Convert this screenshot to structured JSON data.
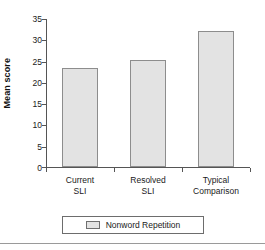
{
  "chart_data": {
    "type": "bar",
    "title": "",
    "xlabel": "",
    "ylabel": "Mean score",
    "ylim": [
      0,
      35
    ],
    "yticks": [
      0,
      5,
      10,
      15,
      20,
      25,
      30,
      35
    ],
    "ytick_labels": [
      "0",
      "5",
      "10",
      "15",
      "20",
      "25",
      "30",
      "35"
    ],
    "grid": false,
    "legend_position": "bottom",
    "categories": [
      "Current SLI",
      "Resolved SLI",
      "Typical Comparison"
    ],
    "category_lines": [
      [
        "Current",
        "SLI"
      ],
      [
        "Resolved",
        "SLI"
      ],
      [
        "Typical",
        "Comparison"
      ]
    ],
    "series": [
      {
        "name": "Nonword Repetition",
        "values": [
          23.5,
          25.3,
          32.2
        ],
        "fill_color": "#e3e3e3",
        "edge_color": "#8d8d8d"
      }
    ]
  },
  "legend": {
    "entries": [
      {
        "label": "Nonword Repetition",
        "swatch_name": "nonword-repetition-swatch"
      }
    ]
  },
  "colors": {
    "bar_fill": "#e3e3e3",
    "bar_edge": "#8d8d8d",
    "axis": "#555555",
    "text": "#1a1a1a",
    "rule": "#9a9a9a",
    "background": "#ffffff"
  }
}
